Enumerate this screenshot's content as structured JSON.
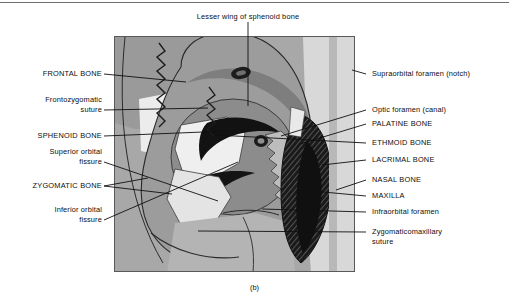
{
  "figure": {
    "caption": "(b)",
    "artist_signature": "D. Apple",
    "frame": {
      "x": 114,
      "y": 36,
      "width": 241,
      "height": 236
    }
  },
  "colors": {
    "background": "#ffffff",
    "rule": "#6f6f6f",
    "frame_border": "#58595b",
    "text": "#0d0d0d",
    "tone_pale": "#ededed",
    "tone_light": "#cfcfcf",
    "tone_mid": "#a8a8a8",
    "tone_medium": "#939393",
    "tone_dark": "#6e6e6e",
    "tone_black": "#111111"
  },
  "labels": {
    "top": [
      {
        "id": "lesser-wing-of-sphenoid-bone",
        "text": "Lesser wing of sphenoid bone",
        "style": "sentence"
      }
    ],
    "left": [
      {
        "id": "frontal-bone",
        "text": "FRONTAL BONE",
        "style": "caps"
      },
      {
        "id": "frontozygomatic-suture",
        "text": "Frontozygomatic\nsuture",
        "style": "sentence"
      },
      {
        "id": "sphenoid-bone",
        "text": "SPHENOID BONE",
        "style": "caps"
      },
      {
        "id": "superior-orbital-fissure",
        "text": "Superior orbital\nfissure",
        "style": "sentence"
      },
      {
        "id": "zygomatic-bone",
        "text": "ZYGOMATIC BONE",
        "style": "caps"
      },
      {
        "id": "inferior-orbital-fissure",
        "text": "Inferior orbital\nfissure",
        "style": "sentence"
      }
    ],
    "right": [
      {
        "id": "supraorbital-foramen-notch",
        "text": "Supraorbital foramen (notch)",
        "style": "sentence"
      },
      {
        "id": "optic-foramen-canal",
        "text": "Optic foramen (canal)",
        "style": "sentence"
      },
      {
        "id": "palatine-bone",
        "text": "PALATINE BONE",
        "style": "caps"
      },
      {
        "id": "ethmoid-bone",
        "text": "ETHMOID BONE",
        "style": "caps"
      },
      {
        "id": "lacrimal-bone",
        "text": "LACRIMAL BONE",
        "style": "caps"
      },
      {
        "id": "nasal-bone",
        "text": "NASAL BONE",
        "style": "caps"
      },
      {
        "id": "maxilla",
        "text": "MAXILLA",
        "style": "caps"
      },
      {
        "id": "infraorbital-foramen",
        "text": "Infraorbital foramen",
        "style": "sentence"
      },
      {
        "id": "zygomaticomaxillary-suture",
        "text": "Zygomaticomaxillary\nsuture",
        "style": "sentence"
      }
    ]
  }
}
